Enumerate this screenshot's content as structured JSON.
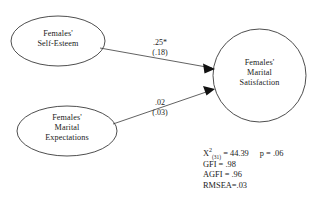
{
  "figure": {
    "type": "path-diagram",
    "title": "",
    "background_color": "#ffffff",
    "line_color": "#3a3a3a"
  },
  "nodes": [
    {
      "id": "self_esteem",
      "shape": "ellipse",
      "line1": "Females'",
      "line2": "Self-Esteem",
      "line3": ""
    },
    {
      "id": "marital_expectations",
      "shape": "ellipse",
      "line1": "Females'",
      "line2": "Marital",
      "line3": "Expectations"
    },
    {
      "id": "marital_satisfaction",
      "shape": "circle",
      "line1": "Females'",
      "line2": "Marital",
      "line3": "Satisfaction"
    }
  ],
  "paths": [
    {
      "id": "path_se_to_ms",
      "from": "self_esteem",
      "to": "marital_satisfaction",
      "estimate": ".25*",
      "standard_error": "(.18)"
    },
    {
      "id": "path_me_to_ms",
      "from": "marital_expectations",
      "to": "marital_satisfaction",
      "estimate": ".02",
      "standard_error": "(.03)"
    }
  ],
  "fit_statistics": {
    "chi_square_symbol": "X",
    "chi_square_superscript": "2",
    "chi_square_df": "(31)",
    "chi_square_equals": " = 44.39",
    "p_value": "p = .06",
    "gfi": "GFI = .98",
    "agfi": "AGFI = .96",
    "rmsea": "RMSEA=.03"
  }
}
